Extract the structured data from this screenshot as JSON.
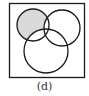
{
  "figure": {
    "caption": "(d)",
    "type": "venn-diagram",
    "sets": 3,
    "shaded_region": "top-left circle only (excluding overlaps)",
    "colors": {
      "stroke": "#1a1a1a",
      "shade": "#d9d9d9",
      "background": "#ffffff"
    }
  }
}
